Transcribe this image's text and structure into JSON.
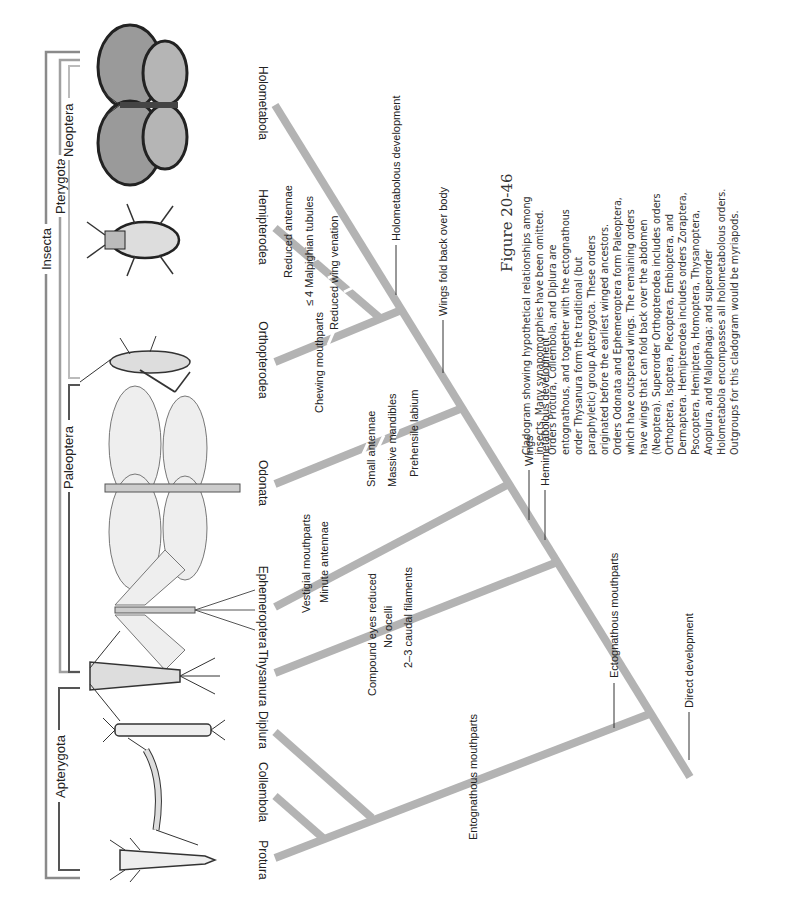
{
  "figure": {
    "title": "Figure 20-46",
    "caption_lines": [
      "Cladogram showing hypothetical relationships among",
      "insects. Many synapomorphies have been omitted.",
      "Orders Protura, Collembola, and Diplura are",
      "entognathous, and together with the ectognathous",
      "order Thysanura form the traditional (but",
      "paraphyletic) group Apterygota. These orders",
      "originated before the earliest winged ancestors.",
      "Orders Odonata and Ephemeroptera form Paleoptera,",
      "which have outspread wings. The remaining orders",
      "have wings that can fold back over the abdomen",
      "(Neoptera). Superorder Orthopterodea includes orders",
      "Orthoptera, Isoptera, Plecoptera, Embioptera, and",
      "Dermaptera. Hemipterodea includes orders Zoraptera,",
      "Psocoptera, Hemiptera, Homoptera, Thysanoptera,",
      "Anoplura, and Mallophaga; and superorder",
      "Holometabola encompasses all holometabolous orders.",
      "Outgroups for this cladogram would be myriapods."
    ]
  },
  "groups": {
    "insecta": "Insecta",
    "apterygota": "Apterygota",
    "pterygota": "Pterygota",
    "paleoptera": "Paleoptera",
    "neoptera": "Neoptera"
  },
  "taxa": [
    "Protura",
    "Collembola",
    "Diplura",
    "Thysanura",
    "Ephemeroptera",
    "Odonata",
    "Orthopterodea",
    "Hemipterodea",
    "Holometabola"
  ],
  "traits": {
    "direct_development": "Direct development",
    "entognathous_mouthparts": "Entognathous mouthparts",
    "ectognathous_mouthparts": "Ectognathous mouthparts",
    "compound_eyes_reduced": "Compound eyes reduced",
    "no_ocelli": "No ocelli",
    "caudal_filaments": "2–3 caudal filaments",
    "wings": "Wings",
    "hemimetabolous_development": "Hemimetabolous development",
    "vestigial_mouthparts": "Vestigial mouthparts",
    "minute_antennae": "Minute antennae",
    "small_antennae": "Small antennae",
    "massive_mandibles": "Massive mandibles",
    "prehensile_labium": "Prehensile labium",
    "wings_fold_back": "Wings fold back over body",
    "holometabolous_development": "Holometabolous development",
    "chewing_mouthparts": "Chewing mouthparts",
    "reduced_antennae": "Reduced antennae",
    "malpighian_tubules": "≤ 4 Malpighian tubules",
    "reduced_wing_venation": "Reduced wing venation"
  },
  "colors": {
    "branch": "#b3b3b3",
    "bracket_dark": "#555555",
    "bracket_light": "#a8a8a8",
    "text": "#222222"
  }
}
